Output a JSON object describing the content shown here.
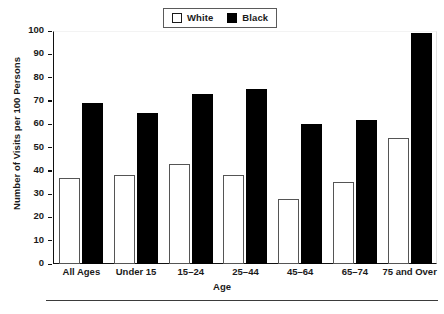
{
  "chart_data": {
    "type": "bar",
    "title": "",
    "xlabel": "Age",
    "ylabel": "Number of Visits per 100 Persons",
    "ylim": [
      0,
      100
    ],
    "yticks": [
      0,
      10,
      20,
      30,
      40,
      50,
      60,
      70,
      80,
      90,
      100
    ],
    "grid": false,
    "legend_position": "top-center",
    "categories": [
      "All Ages",
      "Under 15",
      "15–24",
      "25–44",
      "45–64",
      "65–74",
      "75 and Over"
    ],
    "series": [
      {
        "name": "White",
        "color": "#ffffff",
        "edge_color": "#555555",
        "values": [
          37,
          38,
          43,
          38,
          28,
          35,
          54
        ]
      },
      {
        "name": "Black",
        "color": "#000000",
        "edge_color": "#000000",
        "values": [
          69,
          65,
          73,
          75,
          60,
          62,
          99
        ]
      }
    ]
  },
  "legend": {
    "entries": [
      {
        "label": "White",
        "swatch": "open-square-icon"
      },
      {
        "label": "Black",
        "swatch": "filled-square-icon"
      }
    ]
  },
  "footer": {
    "caption": ""
  }
}
